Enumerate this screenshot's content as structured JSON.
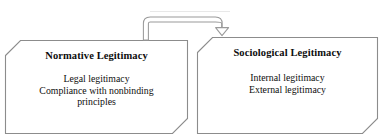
{
  "diagram": {
    "type": "two-box-flow",
    "background_color": "#ffffff",
    "outline_color": "#8c8c8c",
    "text_color": "#0d0d0d",
    "boxes": [
      {
        "id": "normative",
        "title": "Normative Legitimacy",
        "body_lines": [
          "Legal legitimacy",
          "Compliance with nonbinding",
          "principles"
        ]
      },
      {
        "id": "sociological",
        "title": "Sociological Legitimacy",
        "body_lines": [
          "Internal legitimacy",
          "External legitimacy"
        ]
      }
    ],
    "connector": {
      "name": "curved-block-arrow",
      "from": "normative",
      "to": "sociological",
      "direction": "left-to-right"
    }
  }
}
